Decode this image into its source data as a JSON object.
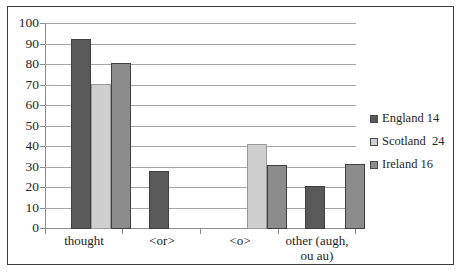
{
  "chart_data": {
    "type": "bar",
    "title": "",
    "subtitle": "",
    "xlabel": "",
    "ylabel": "",
    "ylim": [
      0,
      100
    ],
    "ytick_step": 10,
    "yticks": [
      "100",
      "90",
      "80",
      "70",
      "60",
      "50",
      "40",
      "30",
      "20",
      "10",
      "0"
    ],
    "grid": true,
    "legend_position": "right",
    "categories": [
      "thought",
      "<or>",
      "<o>",
      "other (augh, ou au)"
    ],
    "series": [
      {
        "name": "England 14",
        "color": "#595959",
        "values": [
          92.5,
          28.5,
          0,
          21
        ]
      },
      {
        "name": "Scotland  24",
        "color": "#cfcfcf",
        "values": [
          70.5,
          0,
          41.5,
          0
        ]
      },
      {
        "name": "Ireland 16",
        "color": "#8c8c8c",
        "values": [
          81,
          0,
          31,
          31.5
        ]
      }
    ]
  },
  "legend": {
    "items": [
      {
        "label": "England 14",
        "swatch": "legend-swatch-england"
      },
      {
        "label": "Scotland  24",
        "swatch": "legend-swatch-scotland"
      },
      {
        "label": "Ireland 16",
        "swatch": "legend-swatch-ireland"
      }
    ]
  },
  "axes": {
    "y": {
      "labels": [
        "100",
        "90",
        "80",
        "70",
        "60",
        "50",
        "40",
        "30",
        "20",
        "10",
        "0"
      ]
    },
    "x": {
      "labels": [
        {
          "line1": "thought",
          "line2": ""
        },
        {
          "line1": "<or>",
          "line2": ""
        },
        {
          "line1": "<o>",
          "line2": ""
        },
        {
          "line1": "other (augh,",
          "line2": "ou au)"
        }
      ]
    }
  }
}
